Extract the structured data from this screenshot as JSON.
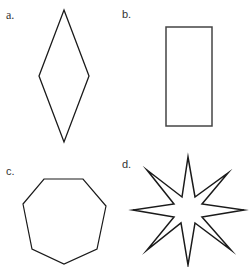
{
  "figure": {
    "panels": [
      {
        "label": "a.",
        "shape": "rhombus",
        "points": "64,10 89,76 64,142 39,76"
      },
      {
        "label": "b.",
        "shape": "rectangle",
        "x": 166,
        "y": 27,
        "width": 46,
        "height": 99
      },
      {
        "label": "c.",
        "shape": "heptagon",
        "points": "44,179 83,179 106,206 97,249 64,264 32,249 23,204"
      },
      {
        "label": "d.",
        "shape": "eight-pointed-star",
        "points": "188,157 195,197 228,173 202,204 244,210 202,217 231,250 195,223 188,265 181,223 147,250 174,217 133,210 174,204 147,170 182,197"
      }
    ],
    "stroke_color": "#1a1a1a",
    "rect_stroke_color": "#444444"
  }
}
